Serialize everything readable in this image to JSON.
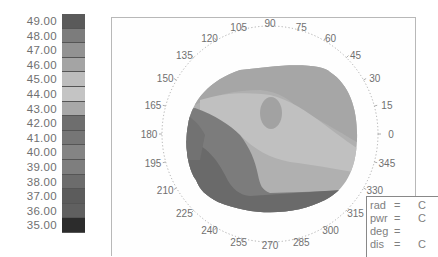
{
  "chart_data": {
    "type": "heatmap",
    "subtype": "polar-contour",
    "title": "",
    "colorbar": {
      "levels": [
        "49.00",
        "48.00",
        "47.00",
        "46.00",
        "45.00",
        "44.00",
        "43.00",
        "42.00",
        "41.00",
        "40.00",
        "39.00",
        "38.00",
        "37.00",
        "36.00",
        "35.00"
      ],
      "colors": [
        "#5a5a5a",
        "#7c7c7c",
        "#929292",
        "#a4a4a4",
        "#bdbdbd",
        "#c4c4c4",
        "#a8a8a8",
        "#6e6e6e",
        "#767676",
        "#848484",
        "#7e7e7e",
        "#6c6c6c",
        "#5c5c5c",
        "#606060",
        "#2c2c2c"
      ]
    },
    "angular_ticks": [
      "105",
      "90",
      "75",
      "60",
      "45",
      "30",
      "15",
      "0",
      "345",
      "330",
      "315",
      "300",
      "285",
      "270",
      "255",
      "240",
      "225",
      "210",
      "195",
      "180",
      "165",
      "150",
      "135",
      "120"
    ],
    "regions": [
      {
        "name": "upper",
        "approx_level": "46.00",
        "color": "#a6a6a6"
      },
      {
        "name": "central-light-band",
        "approx_level": "45.00",
        "color": "#c0c0c0"
      },
      {
        "name": "island",
        "approx_level": "46.00",
        "color": "#a0a0a0"
      },
      {
        "name": "mid-band",
        "approx_level": "43.00",
        "color": "#b0b0b0"
      },
      {
        "name": "left-dark",
        "approx_level": "39.00",
        "color": "#7a7a7a"
      },
      {
        "name": "bottom-dark",
        "approx_level": "37.00",
        "color": "#686868"
      }
    ]
  },
  "info_box": {
    "rows": [
      {
        "key": "rad",
        "eq": "=",
        "value": "C"
      },
      {
        "key": "pwr",
        "eq": "=",
        "value": "C"
      },
      {
        "key": "deg",
        "eq": "=",
        "value": ""
      },
      {
        "key": "dis",
        "eq": "=",
        "value": "C"
      }
    ]
  }
}
